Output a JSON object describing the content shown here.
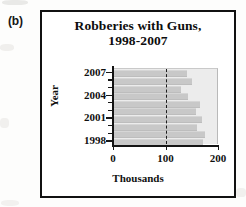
{
  "figure": {
    "panel_label": "(b)",
    "title_line1": "Robberies with Guns,",
    "title_line2": "1998-2007"
  },
  "chart_data": {
    "type": "bar",
    "orientation": "horizontal",
    "title": "Robberies with Guns, 1998-2007",
    "xlabel": "Thousands",
    "ylabel": "Year",
    "categories": [
      "2007",
      "2006",
      "2005",
      "2004",
      "2003",
      "2002",
      "2001",
      "2000",
      "1999",
      "1998"
    ],
    "values": [
      140,
      150,
      130,
      142,
      165,
      158,
      170,
      160,
      175,
      172
    ],
    "xlim": [
      0,
      200
    ],
    "xticks": [
      0,
      100,
      200
    ],
    "xtick_labels": [
      "0",
      "100",
      "200"
    ],
    "ytick_labels": [
      "2007",
      "2004",
      "2001",
      "1998"
    ],
    "reference_line": 100,
    "reference_line_style": "dashed",
    "grid": false,
    "legend": false,
    "bar_color": "#c8c8c8",
    "plot_background": "#ececec",
    "axis_color": "#141414"
  }
}
